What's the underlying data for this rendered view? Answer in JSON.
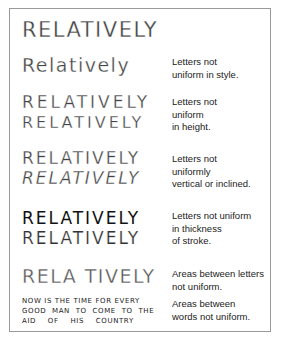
{
  "figure": {
    "heading_example": "RELATIVELY",
    "rows": [
      {
        "examples": [
          "Relatively"
        ],
        "description": [
          "Letters not",
          "uniform in style."
        ]
      },
      {
        "examples": [
          "RELATIVELY",
          "RELATIVELY"
        ],
        "description": [
          "Letters not",
          "uniform",
          "in height."
        ]
      },
      {
        "examples": [
          "RELATIVELY",
          "RELATIVELY"
        ],
        "description": [
          "Letters not",
          "uniformly",
          "vertical or inclined."
        ]
      },
      {
        "examples": [
          "RELATIVELY",
          "RELATIVELY"
        ],
        "description": [
          "Letters not uniform",
          "in thickness",
          "of stroke."
        ]
      },
      {
        "examples": [
          "RELA TIVELY"
        ],
        "description": [
          "Areas between letters",
          "not uniform."
        ]
      },
      {
        "examples": [
          "NOW IS THE TIME FOR EVERY",
          "GOOD MAN TO COME TO THE",
          "AID OF HIS COUNTRY"
        ],
        "description": [
          "Areas between",
          "words not uniform."
        ]
      }
    ]
  }
}
